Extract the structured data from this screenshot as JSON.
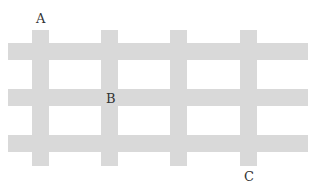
{
  "diagram": {
    "type": "grid-of-streets",
    "bar_color": "#d9d9d9",
    "label_color": "#333333",
    "horizontal_bars": [
      {
        "x": 8,
        "y": 43,
        "w": 300,
        "h": 17
      },
      {
        "x": 8,
        "y": 89,
        "w": 300,
        "h": 17
      },
      {
        "x": 8,
        "y": 135,
        "w": 300,
        "h": 17
      }
    ],
    "vertical_bars": [
      {
        "x": 32,
        "y": 30,
        "w": 17,
        "h": 136
      },
      {
        "x": 101,
        "y": 30,
        "w": 17,
        "h": 136
      },
      {
        "x": 170,
        "y": 30,
        "w": 17,
        "h": 136
      },
      {
        "x": 240,
        "y": 30,
        "w": 17,
        "h": 136
      }
    ],
    "labels": [
      {
        "text": "A",
        "x": 36,
        "y": 12
      },
      {
        "text": "B",
        "x": 106,
        "y": 92
      },
      {
        "text": "C",
        "x": 244,
        "y": 170
      }
    ]
  }
}
